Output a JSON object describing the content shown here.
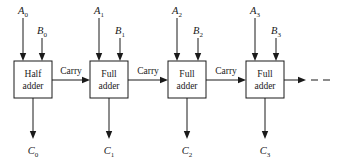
{
  "diagram": {
    "type": "block-diagram",
    "background_color": "#ffffff",
    "line_color": "#1a1a1a",
    "blocks": [
      {
        "id": "block-0",
        "line1": "Half",
        "line2": "adder",
        "x": 14,
        "y": 61,
        "w": 38,
        "h": 37
      },
      {
        "id": "block-1",
        "line1": "Full",
        "line2": "adder",
        "x": 90,
        "y": 61,
        "w": 38,
        "h": 37
      },
      {
        "id": "block-2",
        "line1": "Full",
        "line2": "adder",
        "x": 168,
        "y": 61,
        "w": 38,
        "h": 37
      },
      {
        "id": "block-3",
        "line1": "Full",
        "line2": "adder",
        "x": 246,
        "y": 61,
        "w": 38,
        "h": 37
      }
    ],
    "inputs_a": [
      {
        "id": "input-a0",
        "base": "A",
        "sub": "0",
        "x": 23,
        "label_y": 14,
        "line_top": 18,
        "line_bottom": 61
      },
      {
        "id": "input-a1",
        "base": "A",
        "sub": "1",
        "x": 99,
        "label_y": 14,
        "line_top": 18,
        "line_bottom": 61
      },
      {
        "id": "input-a2",
        "base": "A",
        "sub": "2",
        "x": 177,
        "label_y": 14,
        "line_top": 18,
        "line_bottom": 61
      },
      {
        "id": "input-a3",
        "base": "A",
        "sub": "3",
        "x": 255,
        "label_y": 14,
        "line_top": 18,
        "line_bottom": 61
      }
    ],
    "inputs_b": [
      {
        "id": "input-b0",
        "base": "B",
        "sub": "0",
        "x": 42,
        "label_y": 34,
        "line_top": 38,
        "line_bottom": 61
      },
      {
        "id": "input-b1",
        "base": "B",
        "sub": "1",
        "x": 120,
        "label_y": 34,
        "line_top": 38,
        "line_bottom": 61
      },
      {
        "id": "input-b2",
        "base": "B",
        "sub": "2",
        "x": 198,
        "label_y": 34,
        "line_top": 38,
        "line_bottom": 61
      },
      {
        "id": "input-b3",
        "base": "B",
        "sub": "3",
        "x": 276,
        "label_y": 34,
        "line_top": 38,
        "line_bottom": 61
      }
    ],
    "outputs_c": [
      {
        "id": "output-c0",
        "base": "C",
        "sub": "0",
        "x": 33,
        "line_top": 98,
        "line_bottom": 139,
        "label_y": 154
      },
      {
        "id": "output-c1",
        "base": "C",
        "sub": "1",
        "x": 109,
        "line_top": 98,
        "line_bottom": 139,
        "label_y": 154
      },
      {
        "id": "output-c2",
        "base": "C",
        "sub": "2",
        "x": 187,
        "line_top": 98,
        "line_bottom": 139,
        "label_y": 154
      },
      {
        "id": "output-c3",
        "base": "C",
        "sub": "3",
        "x": 265,
        "line_top": 98,
        "line_bottom": 139,
        "label_y": 154
      }
    ],
    "carry_links": [
      {
        "id": "carry-link-0",
        "label": "Carry",
        "x_start": 52,
        "x_end": 90,
        "y": 80,
        "label_x": 71,
        "label_y": 74
      },
      {
        "id": "carry-link-1",
        "label": "Carry",
        "x_start": 128,
        "x_end": 168,
        "y": 80,
        "label_x": 148,
        "label_y": 74
      },
      {
        "id": "carry-link-2",
        "label": "Carry",
        "x_start": 206,
        "x_end": 246,
        "y": 80,
        "label_x": 226,
        "label_y": 74
      }
    ],
    "carry_out": {
      "id": "carry-out-continuation",
      "x_start": 284,
      "x_arrow": 306,
      "x_dash_start": 311,
      "x_dash_end": 333,
      "y": 80
    }
  }
}
